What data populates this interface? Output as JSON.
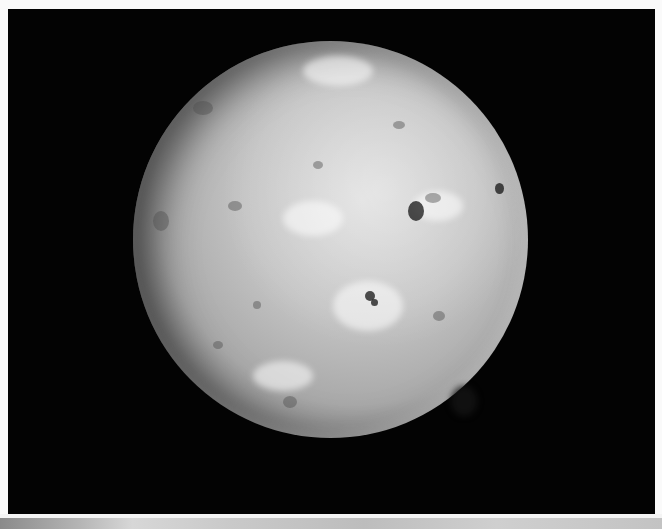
{
  "image": {
    "subject": "moon",
    "description": "Grayscale photograph of a cratered, mottled moon against a black background",
    "colors": {
      "background": "#030303",
      "page": "#fafafa",
      "moon_highlight": "#d9d9d9",
      "moon_shadow": "#3a3a3a"
    }
  }
}
